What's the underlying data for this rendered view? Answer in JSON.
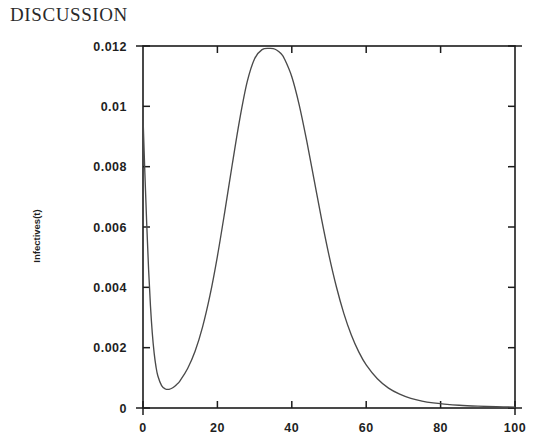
{
  "page": {
    "heading": "DISCUSSION"
  },
  "chart_data": {
    "type": "line",
    "title": "",
    "xlabel": "",
    "ylabel": "Infectives(t)",
    "xlim": [
      0,
      100
    ],
    "ylim": [
      0,
      0.012
    ],
    "grid": false,
    "legend": null,
    "x_ticks": [
      0,
      20,
      40,
      60,
      80,
      100
    ],
    "x_tick_labels": [
      "0",
      "20",
      "40",
      "60",
      "80",
      "100"
    ],
    "y_ticks": [
      0,
      0.002,
      0.004,
      0.006,
      0.008,
      0.01,
      0.012
    ],
    "y_tick_labels": [
      "0",
      "0.002",
      "0.004",
      "0.006",
      "0.008",
      "0.01",
      "0.012"
    ],
    "series": [
      {
        "name": "Infectives(t)",
        "color": "#4a4a4a",
        "x": [
          0,
          0.5,
          1,
          1.5,
          2,
          2.5,
          3,
          3.5,
          4,
          5,
          6,
          7,
          8,
          9,
          10,
          12,
          14,
          16,
          18,
          20,
          22,
          24,
          26,
          28,
          30,
          32,
          34,
          35,
          36,
          37,
          38,
          40,
          42,
          44,
          46,
          48,
          50,
          52,
          54,
          56,
          58,
          60,
          63,
          66,
          69,
          72,
          75,
          78,
          81,
          85,
          90,
          95,
          100
        ],
        "y": [
          0.00965,
          0.0078,
          0.0061,
          0.0046,
          0.0034,
          0.00248,
          0.00182,
          0.00136,
          0.00106,
          0.00074,
          0.00063,
          0.00062,
          0.00067,
          0.00077,
          0.00091,
          0.00131,
          0.00188,
          0.00268,
          0.00373,
          0.00503,
          0.00652,
          0.00808,
          0.00957,
          0.01081,
          0.01158,
          0.01188,
          0.01192,
          0.01191,
          0.01186,
          0.01176,
          0.01158,
          0.01098,
          0.01004,
          0.00886,
          0.00756,
          0.00626,
          0.00506,
          0.00401,
          0.00313,
          0.00242,
          0.00186,
          0.00143,
          0.00097,
          0.00066,
          0.00046,
          0.00032,
          0.00023,
          0.00017,
          0.00013,
          9e-05,
          6e-05,
          4e-05,
          3e-05
        ]
      }
    ],
    "annotations": {
      "peak_t": 35,
      "peak_value": 0.0119,
      "initial_value": 0.00965,
      "trough_t": 6.5,
      "trough_value": 0.00062
    }
  }
}
